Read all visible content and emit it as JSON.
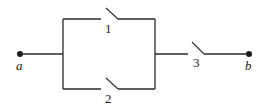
{
  "diagram": {
    "type": "switch-circuit",
    "terminals": [
      {
        "id": "a",
        "label": "a"
      },
      {
        "id": "b",
        "label": "b"
      }
    ],
    "switches": [
      {
        "id": "1",
        "label": "1",
        "state": "open",
        "branch": "parallel-top"
      },
      {
        "id": "2",
        "label": "2",
        "state": "open",
        "branch": "parallel-bottom"
      },
      {
        "id": "3",
        "label": "3",
        "state": "open",
        "branch": "series"
      }
    ],
    "colors": {
      "line": "#2a2a2a",
      "background": "#ffffff"
    }
  }
}
